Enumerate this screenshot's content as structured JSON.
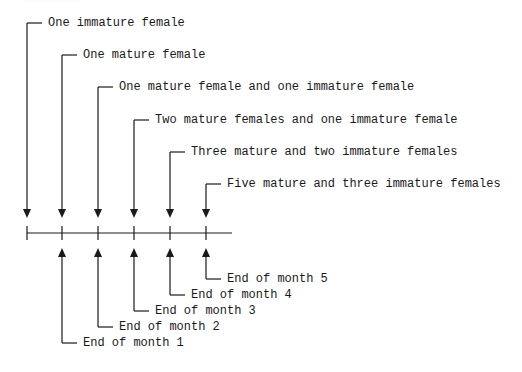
{
  "diagram": {
    "type": "timeline",
    "stroke_color": "#1a1a1a",
    "background": "#ffffff",
    "timeline": {
      "x_start": 27,
      "x_end": 232,
      "y": 233,
      "ticks_x": [
        27,
        62,
        98,
        134,
        170,
        206
      ]
    },
    "population_labels": [
      {
        "text": "One immature female",
        "x_line": 27,
        "y": 23
      },
      {
        "text": "One mature female",
        "x_line": 62,
        "y": 55
      },
      {
        "text": "One mature female and one immature female",
        "x_line": 98,
        "y": 87
      },
      {
        "text": "Two mature females and one immature female",
        "x_line": 134,
        "y": 120
      },
      {
        "text": "Three mature and two immature females",
        "x_line": 170,
        "y": 152
      },
      {
        "text": "Five mature and three immature females",
        "x_line": 206,
        "y": 184
      }
    ],
    "month_labels": [
      {
        "text": "End of month 1",
        "x_line": 62,
        "y": 343
      },
      {
        "text": "End of month 2",
        "x_line": 98,
        "y": 327
      },
      {
        "text": "End of month 3",
        "x_line": 134,
        "y": 311
      },
      {
        "text": "End of month 4",
        "x_line": 170,
        "y": 295
      },
      {
        "text": "End of month 5",
        "x_line": 206,
        "y": 279
      }
    ]
  }
}
